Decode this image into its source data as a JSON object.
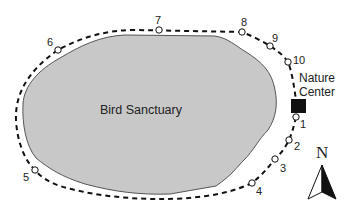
{
  "diagram": {
    "region": {
      "label": "Bird Sanctuary",
      "fill_color": "#c8c8c8",
      "stroke_color": "#555555"
    },
    "landmark": {
      "label_line1": "Nature",
      "label_line2": "Center",
      "color": "#111111"
    },
    "trail": {
      "style": "dashed",
      "color": "#111111",
      "stops": [
        {
          "id": "1",
          "label": "1"
        },
        {
          "id": "2",
          "label": "2"
        },
        {
          "id": "3",
          "label": "3"
        },
        {
          "id": "4",
          "label": "4"
        },
        {
          "id": "5",
          "label": "5"
        },
        {
          "id": "6",
          "label": "6"
        },
        {
          "id": "7",
          "label": "7"
        },
        {
          "id": "8",
          "label": "8"
        },
        {
          "id": "9",
          "label": "9"
        },
        {
          "id": "10",
          "label": "10"
        }
      ]
    },
    "compass": {
      "label": "N",
      "icon": "north-arrow-icon"
    }
  }
}
